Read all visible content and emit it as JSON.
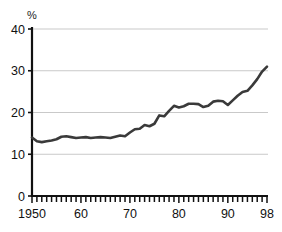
{
  "chart_data": {
    "type": "line",
    "title": "",
    "subtitle": "",
    "xlabel": "",
    "ylabel": "%",
    "unit_label": "%",
    "grid": true,
    "grid_axis": "y",
    "legend": false,
    "legend_position": "none",
    "xlim": [
      1950,
      1998
    ],
    "ylim": [
      0,
      40
    ],
    "ytick_labels": [
      "40",
      "30",
      "20",
      "10",
      "0"
    ],
    "ytick_values": [
      40,
      30,
      20,
      10,
      0
    ],
    "xtick_labels": [
      "1950",
      "60",
      "70",
      "80",
      "90",
      "98"
    ],
    "xtick_values": [
      1950,
      1960,
      1970,
      1980,
      1990,
      1998
    ],
    "minor_xtick_interval": 1,
    "series": [
      {
        "name": "percent",
        "color": "#3a3a3a",
        "line_width": 2.6,
        "x": [
          1950,
          1951,
          1952,
          1953,
          1954,
          1955,
          1956,
          1957,
          1958,
          1959,
          1960,
          1961,
          1962,
          1963,
          1964,
          1965,
          1966,
          1967,
          1968,
          1969,
          1970,
          1971,
          1972,
          1973,
          1974,
          1975,
          1976,
          1977,
          1978,
          1979,
          1980,
          1981,
          1982,
          1983,
          1984,
          1985,
          1986,
          1987,
          1988,
          1989,
          1990,
          1991,
          1992,
          1993,
          1994,
          1995,
          1996,
          1997,
          1998
        ],
        "values": [
          14.0,
          13.1,
          12.9,
          13.1,
          13.3,
          13.6,
          14.2,
          14.3,
          14.1,
          13.9,
          14.0,
          14.1,
          13.9,
          14.0,
          14.1,
          14.0,
          13.9,
          14.2,
          14.5,
          14.3,
          15.2,
          16.0,
          16.1,
          17.0,
          16.7,
          17.3,
          19.3,
          19.1,
          20.4,
          21.6,
          21.2,
          21.5,
          22.1,
          22.1,
          22.0,
          21.3,
          21.6,
          22.6,
          22.8,
          22.7,
          21.8,
          22.9,
          24.0,
          24.9,
          25.2,
          26.5,
          28.0,
          29.8,
          31.0
        ]
      }
    ],
    "axis_color": "#111111",
    "grid_color": "#c9c9c9",
    "background_color": "#ffffff"
  },
  "plot_geometry": {
    "left": 32,
    "right": 267,
    "top": 29,
    "bottom": 196
  }
}
